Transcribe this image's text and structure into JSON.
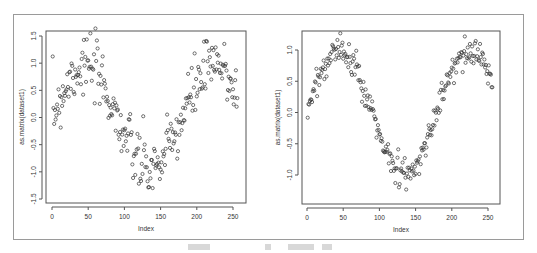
{
  "chart_data": [
    {
      "type": "scatter",
      "title": "",
      "xlabel": "Index",
      "ylabel": "as.matrix(dataset1)",
      "xlim": [
        0,
        256
      ],
      "ylim": [
        -1.55,
        1.55
      ],
      "xticks": [
        0,
        50,
        100,
        150,
        200,
        250
      ],
      "yticks": [
        -1.5,
        -1.0,
        -0.5,
        0.0,
        0.5,
        1.0,
        1.5
      ],
      "ytick_labels": [
        "-1.5",
        "-1.0",
        "-0.5",
        "0.0",
        "0.5",
        "1.0",
        "1.5"
      ],
      "grid": false,
      "marker": "open-circle",
      "description": "256 points following a noisy sine wave, period ~180, amplitude ~1, noise sd ~0.25",
      "model": {
        "amplitude": 0.95,
        "period": 180,
        "noise": 0.28,
        "seed": 7
      },
      "n": 256
    },
    {
      "type": "scatter",
      "title": "",
      "xlabel": "Index",
      "ylabel": "as.matrix(dataset1)",
      "xlim": [
        0,
        256
      ],
      "ylim": [
        -1.4,
        1.25
      ],
      "xticks": [
        0,
        50,
        100,
        150,
        200,
        250
      ],
      "yticks": [
        -1.0,
        -0.5,
        0.0,
        0.5,
        1.0
      ],
      "ytick_labels": [
        "-1.0",
        "-0.5",
        "0.0",
        "0.5",
        "1.0"
      ],
      "grid": false,
      "marker": "open-circle",
      "description": "256 points following a smoother sine wave, period ~180, amplitude ~1, noise sd ~0.1",
      "model": {
        "amplitude": 0.98,
        "period": 180,
        "noise": 0.11,
        "seed": 13
      },
      "n": 256
    }
  ],
  "caption": {
    "text": ""
  }
}
